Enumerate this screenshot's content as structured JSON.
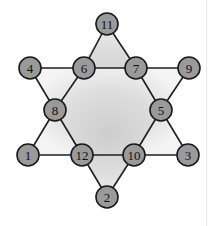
{
  "colors": {
    "node_fill": "#9a9a9a",
    "node_stroke": "#1a1a1a",
    "edge": "#1e1e1e",
    "fill_center": "#cfcfcf",
    "fill_edge": "#f2f2f2",
    "background": "#ffffff"
  },
  "nodes": [
    {
      "id": "11",
      "label": "11",
      "x": 107,
      "y": 24
    },
    {
      "id": "4",
      "label": "4",
      "x": 30,
      "y": 68
    },
    {
      "id": "6",
      "label": "6",
      "x": 84,
      "y": 68
    },
    {
      "id": "7",
      "label": "7",
      "x": 136,
      "y": 68
    },
    {
      "id": "9",
      "label": "9",
      "x": 189,
      "y": 68
    },
    {
      "id": "8",
      "label": "8",
      "x": 55,
      "y": 110
    },
    {
      "id": "5",
      "label": "5",
      "x": 161,
      "y": 110
    },
    {
      "id": "1",
      "label": "1",
      "x": 28,
      "y": 155
    },
    {
      "id": "12",
      "label": "12",
      "x": 82,
      "y": 155
    },
    {
      "id": "10",
      "label": "10",
      "x": 134,
      "y": 155
    },
    {
      "id": "3",
      "label": "3",
      "x": 188,
      "y": 155
    },
    {
      "id": "2",
      "label": "2",
      "x": 107,
      "y": 197
    }
  ],
  "edges": [
    [
      "11",
      "6"
    ],
    [
      "6",
      "8"
    ],
    [
      "8",
      "1"
    ],
    [
      "11",
      "7"
    ],
    [
      "7",
      "5"
    ],
    [
      "5",
      "3"
    ],
    [
      "1",
      "12"
    ],
    [
      "12",
      "10"
    ],
    [
      "10",
      "3"
    ],
    [
      "4",
      "6"
    ],
    [
      "6",
      "7"
    ],
    [
      "7",
      "9"
    ],
    [
      "4",
      "8"
    ],
    [
      "8",
      "12"
    ],
    [
      "12",
      "2"
    ],
    [
      "9",
      "5"
    ],
    [
      "5",
      "10"
    ],
    [
      "10",
      "2"
    ]
  ]
}
